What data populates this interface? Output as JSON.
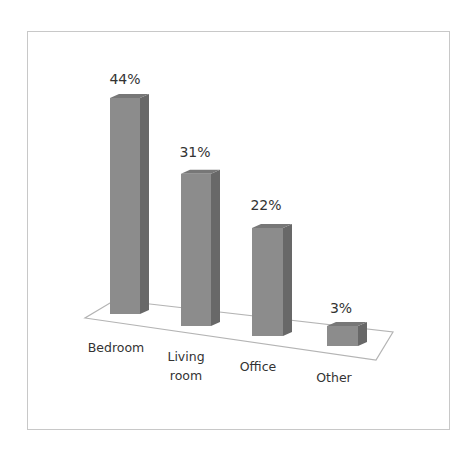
{
  "chart_data": {
    "type": "bar",
    "style": "3d-column",
    "title": "",
    "xlabel": "",
    "ylabel": "",
    "categories": [
      "Bedroom",
      "Living room",
      "Office",
      "Other"
    ],
    "category_lines": [
      [
        "Bedroom"
      ],
      [
        "Living",
        "room"
      ],
      [
        "Office"
      ],
      [
        "Other"
      ]
    ],
    "values": [
      44,
      31,
      22,
      3
    ],
    "value_labels": [
      "44%",
      "31%",
      "22%",
      "3%"
    ],
    "unit": "%",
    "ylim": [
      0,
      50
    ],
    "grid": false,
    "legend": "none",
    "axis_visible": false
  },
  "colors": {
    "bar_front": "#8c8c8c",
    "bar_side": "#686868",
    "bar_top": "#777777",
    "floor_stroke": "#b4b4b4",
    "frame_border": "#c8c8c8",
    "text": "#333333"
  }
}
